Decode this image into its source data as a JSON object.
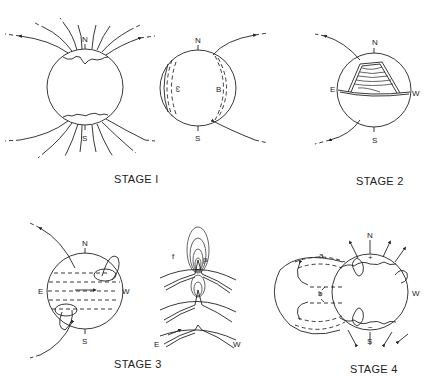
{
  "figure": {
    "type": "multi-panel scientific diagram",
    "panels": [
      {
        "id": "stage1",
        "caption": "STAGE I",
        "subfigures": [
          {
            "id": "stage1-dipole",
            "labels": {
              "north": "N",
              "south": "S"
            }
          },
          {
            "id": "stage1-side",
            "labels": {
              "north": "N",
              "south": "S",
              "left": "ω",
              "right": "B"
            }
          }
        ]
      },
      {
        "id": "stage2",
        "caption": "STAGE 2",
        "labels": {
          "north": "N",
          "south": "S",
          "east": "E",
          "west": "W"
        }
      },
      {
        "id": "stage3",
        "caption": "STAGE 3",
        "subfigures": [
          {
            "id": "stage3-globe",
            "labels": {
              "north": "N",
              "south": "S",
              "east": "E",
              "west": "W"
            }
          },
          {
            "id": "stage3-cross-section",
            "labels": {
              "following": "f",
              "preceding": "p",
              "east": "E",
              "west": "W"
            }
          }
        ]
      },
      {
        "id": "stage4",
        "caption": "STAGE 4",
        "labels": {
          "north": "N",
          "south": "S",
          "west": "W",
          "plus": "+",
          "minus": "−",
          "a": "a",
          "b": "b"
        }
      }
    ]
  }
}
